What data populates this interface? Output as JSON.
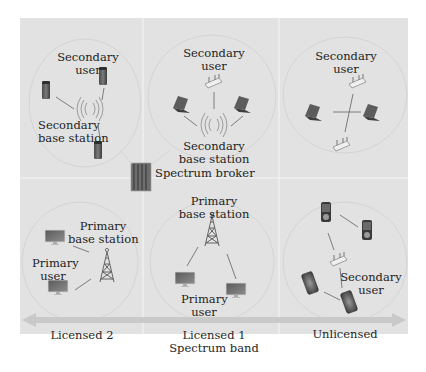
{
  "colors": {
    "page_background": "#ffffff",
    "panel_background": "#e2e2e2",
    "divider": "#f4f4f4",
    "circle_outline": "#cfcfcf",
    "link_line": "#6f6f6f",
    "spectrum_arrow": "#c9c9c9",
    "text": "#1e1e1e"
  },
  "grid": {
    "columns": [
      "Licensed 2",
      "Licensed 1",
      "Unlicensed"
    ],
    "rows": [
      "secondary-network",
      "primary-network"
    ]
  },
  "cells": {
    "top_left": {
      "secondary_user": [
        "Secondary",
        "user"
      ],
      "secondary_base_station": [
        "Secondary",
        "base station"
      ],
      "icons": [
        "server-icon",
        "server-icon",
        "server-icon",
        "wireless-antenna-icon"
      ]
    },
    "top_middle": {
      "secondary_user": [
        "Secondary",
        "user"
      ],
      "secondary_base_station": [
        "Secondary",
        "base station"
      ],
      "icons": [
        "router-icon",
        "laptop-icon",
        "laptop-icon",
        "wireless-antenna-icon"
      ]
    },
    "top_right": {
      "secondary_user": [
        "Secondary",
        "user"
      ],
      "icons": [
        "router-icon",
        "router-icon",
        "laptop-icon",
        "laptop-icon"
      ]
    },
    "bottom_left": {
      "primary_base_station": [
        "Primary",
        "base station"
      ],
      "primary_user": [
        "Primary",
        "user"
      ],
      "icons": [
        "monitor-icon",
        "monitor-icon",
        "tower-icon"
      ]
    },
    "bottom_middle": {
      "primary_base_station": [
        "Primary",
        "base station"
      ],
      "primary_user": [
        "Primary",
        "user"
      ],
      "icons": [
        "tower-icon",
        "monitor-icon",
        "monitor-icon"
      ]
    },
    "bottom_right": {
      "secondary_user": [
        "Secondary",
        "user"
      ],
      "icons": [
        "media-player-icon",
        "media-player-icon",
        "router-icon",
        "smartphone-icon",
        "smartphone-icon"
      ]
    }
  },
  "spectrum_broker": {
    "label": "Spectrum broker",
    "icon": "server-rack-icon"
  },
  "spectrum_axis": {
    "labels": [
      {
        "text": [
          "Licensed 2"
        ]
      },
      {
        "text": [
          "Licensed 1",
          "Spectrum band"
        ]
      },
      {
        "text": [
          "Unlicensed"
        ]
      }
    ]
  }
}
